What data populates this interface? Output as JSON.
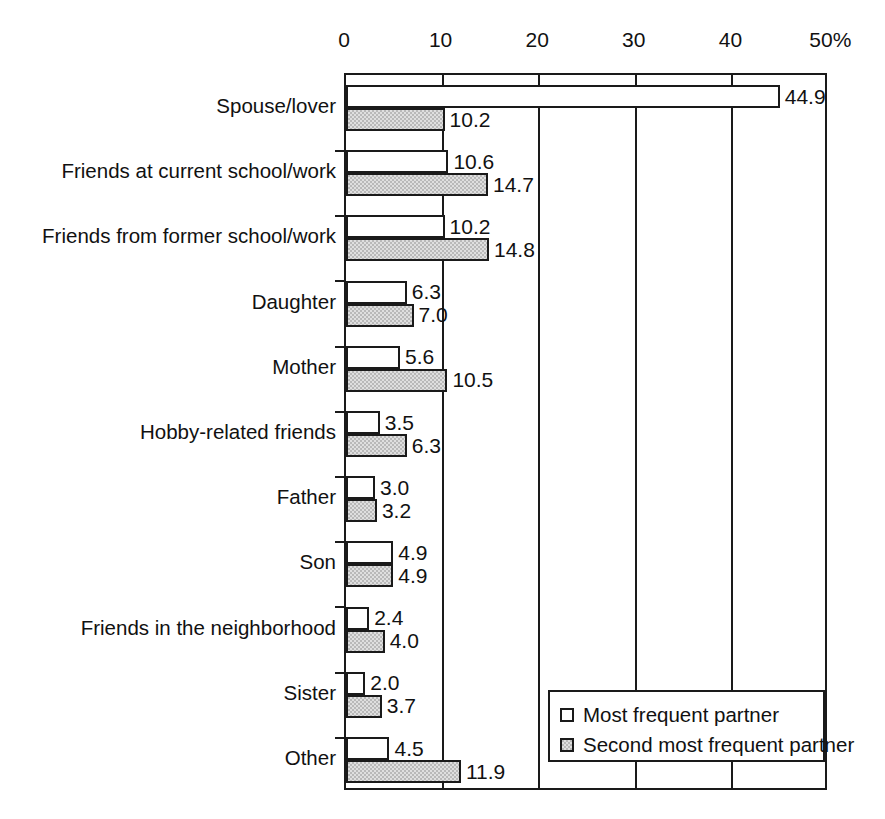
{
  "chart_data": {
    "type": "bar",
    "orientation": "horizontal",
    "title": "",
    "xlabel": "",
    "ylabel": "",
    "xlim": [
      0,
      50
    ],
    "xticks": [
      0,
      10,
      20,
      30,
      40,
      50
    ],
    "xtick_labels": [
      "0",
      "10",
      "20",
      "30",
      "40",
      "50%"
    ],
    "grid": "vertical gridlines at 10, 20, 30, 40",
    "legend_position": "inside lower-right of plot area",
    "categories": [
      "Spouse/lover",
      "Friends at current school/work",
      "Friends from former school/work",
      "Daughter",
      "Mother",
      "Hobby-related friends",
      "Father",
      "Son",
      "Friends in the neighborhood",
      "Sister",
      "Other"
    ],
    "series": [
      {
        "name": "Most frequent partner",
        "style": "white",
        "values": [
          44.9,
          10.6,
          10.2,
          6.3,
          5.6,
          3.5,
          3.0,
          4.9,
          2.4,
          2.0,
          4.5
        ],
        "value_labels": [
          "44.9",
          "10.6",
          "10.2",
          "6.3",
          "5.6",
          "3.5",
          "3.0",
          "4.9",
          "2.4",
          "2.0",
          "4.5"
        ]
      },
      {
        "name": "Second most frequent partner",
        "style": "gray",
        "values": [
          10.2,
          14.7,
          14.8,
          7.0,
          10.5,
          6.3,
          3.2,
          4.9,
          4.0,
          3.7,
          11.9
        ],
        "value_labels": [
          "10.2",
          "14.7",
          "14.8",
          "7.0",
          "10.5",
          "6.3",
          "3.2",
          "4.9",
          "4.0",
          "3.7",
          "11.9"
        ]
      }
    ]
  },
  "legend": {
    "items": [
      {
        "label": "Most frequent partner",
        "swatch": "white"
      },
      {
        "label": "Second most frequent partner",
        "swatch": "gray"
      }
    ]
  },
  "colors": {
    "axis": "#1a1a1a",
    "bar_most": "#ffffff",
    "bar_second": "#b9b9b9",
    "text": "#111111",
    "background": "#ffffff"
  }
}
